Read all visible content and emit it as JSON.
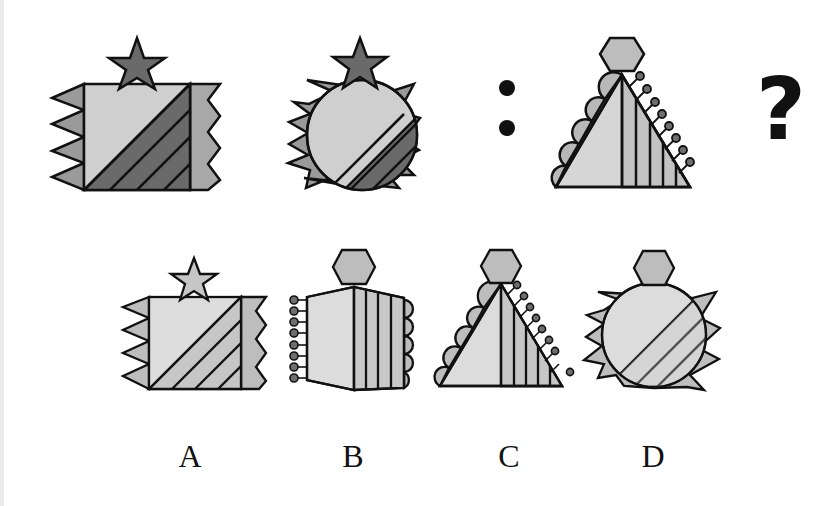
{
  "puzzle": {
    "type": "analogy",
    "relation_marker": ":",
    "question_mark": "?",
    "top_row": [
      {
        "id": "top-1",
        "shape": "square",
        "top_ornament": "star",
        "left_edge": "sawtooth",
        "right_edge": "wavy-band",
        "hatch": "diagonal",
        "shade": "dark"
      },
      {
        "id": "top-2",
        "shape": "circle",
        "top_ornament": "star",
        "surround": "spiky-sun",
        "hatch": "diagonal",
        "shade": "dark"
      },
      {
        "id": "top-3",
        "shape": "triangle",
        "top_ornament": "hexagon",
        "left_edge": "scallops",
        "right_edge": "lollipop-pins",
        "hatch": "vertical",
        "shade": "light"
      }
    ],
    "options": [
      {
        "label": "A",
        "shape": "square",
        "top_ornament": "star",
        "hatch": "diagonal"
      },
      {
        "label": "B",
        "shape": "hexagonal-prism",
        "top_ornament": "hexagon",
        "hatch": "vertical"
      },
      {
        "label": "C",
        "shape": "triangle",
        "top_ornament": "hexagon",
        "hatch": "vertical"
      },
      {
        "label": "D",
        "shape": "circle",
        "top_ornament": "hexagon",
        "hatch": "diagonal"
      }
    ]
  },
  "colors": {
    "light_fill": "#d9d9d9",
    "mid_fill": "#b5b5b5",
    "dark_fill": "#6e6e6e",
    "stroke": "#111111"
  }
}
